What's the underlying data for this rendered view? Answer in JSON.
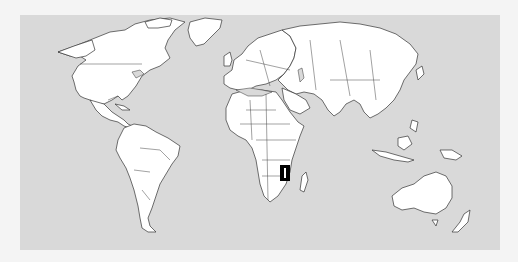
{
  "map": {
    "title": "World map",
    "highlighted_country": "Malawi",
    "colors": {
      "ocean": "#d9d9d9",
      "land": "#ffffff",
      "border": "#333333",
      "highlight": "#000000",
      "background": "#f4f4f4"
    },
    "highlight_marker": {
      "x": 280,
      "y": 165,
      "width": 10,
      "height": 16
    }
  }
}
